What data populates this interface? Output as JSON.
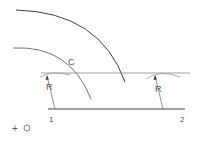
{
  "diagram": {
    "title": "",
    "labels": {
      "arc_label": "C",
      "radius_left": "R",
      "radius_right": "R",
      "point_1": "1",
      "point_2": "2",
      "center_marker": "+",
      "center_label": "O"
    },
    "colors": {
      "stroke_dark": "#444444",
      "stroke_light": "#888888",
      "text": "#555555",
      "background": "#ffffff"
    }
  }
}
